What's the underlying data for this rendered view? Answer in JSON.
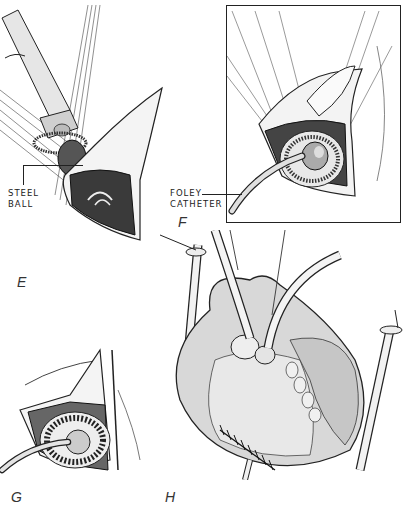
{
  "figure": {
    "panels": [
      {
        "id": "E",
        "letter": "E",
        "description": "Tube inserted through incision with steel ball and stay sutures"
      },
      {
        "id": "F",
        "letter": "F",
        "description": "Boxed view of Foley catheter placed within sutured orifice"
      },
      {
        "id": "G",
        "letter": "G",
        "description": "Catheter seated within circular suture ring"
      },
      {
        "id": "H",
        "letter": "H",
        "description": "Heart with cannulae and sutured closure"
      }
    ],
    "callouts": {
      "steel_ball": [
        "STEEL",
        "BALL"
      ],
      "foley_catheter": [
        "FOLEY",
        "CATHETER"
      ]
    },
    "colors": {
      "ink": "#222222",
      "shade": "#888888",
      "background": "#ffffff"
    }
  }
}
